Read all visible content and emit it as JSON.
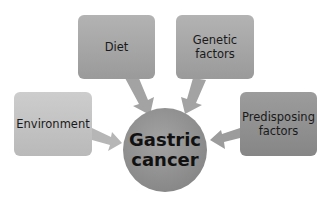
{
  "diagram": {
    "center": {
      "label_line1": "Gastric",
      "label_line2": "cancer",
      "color": "#8c8c8c"
    },
    "factors": [
      {
        "id": "diet",
        "label_line1": "Diet",
        "label_line2": "",
        "color": "#a6a6a6"
      },
      {
        "id": "genetic",
        "label_line1": "Genetic",
        "label_line2": "factors",
        "color": "#a6a6a6"
      },
      {
        "id": "environment",
        "label_line1": "Environment",
        "label_line2": "",
        "color": "#c3c3c3"
      },
      {
        "id": "predisposing",
        "label_line1": "Predisposing",
        "label_line2": "factors",
        "color": "#8f8f8f"
      }
    ],
    "arrow_color": "#a9a9a9"
  }
}
